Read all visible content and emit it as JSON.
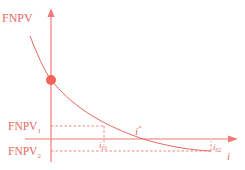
{
  "diagram": {
    "title": "",
    "colors": {
      "accent": "#e8685f",
      "axis": "#f07a74",
      "dot": "#f26457",
      "dash": "#ef7b73"
    },
    "y_axis_label": "FNPV",
    "x_axis_label": "i",
    "labels": {
      "fnpv1": "FNPV",
      "fnpv1_sub": "1",
      "fnpv2": "FNPV",
      "fnpv2_sub": "2",
      "istar": "i",
      "istar_sup": "*",
      "i01": "i",
      "i01_sub": "01",
      "i02": "i",
      "i02_sub": "02"
    }
  }
}
